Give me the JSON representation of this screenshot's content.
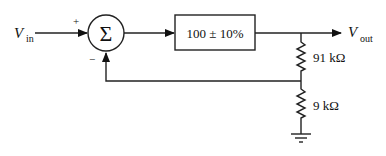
{
  "diagram": {
    "type": "feedback block diagram",
    "input": {
      "label": "V",
      "subscript": "in"
    },
    "output": {
      "label": "V",
      "subscript": "out"
    },
    "summer": {
      "symbol": "Σ",
      "plus_sign": "+",
      "minus_sign": "−"
    },
    "gain_block": {
      "label": "100 ± 10%"
    },
    "resistors": [
      {
        "label": "91 kΩ"
      },
      {
        "label": "9 kΩ"
      }
    ],
    "colors": {
      "line": "#222222",
      "background": "#ffffff"
    }
  }
}
